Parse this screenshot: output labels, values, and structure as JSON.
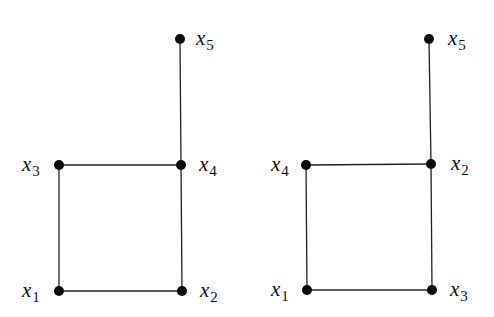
{
  "graphs": [
    {
      "name": "left-graph",
      "nodes": [
        {
          "id": "x1",
          "base": "x",
          "sub": "1",
          "cx": 59,
          "cy": 291,
          "lx": 22,
          "ly": 297
        },
        {
          "id": "x2",
          "base": "x",
          "sub": "2",
          "cx": 182,
          "cy": 291,
          "lx": 200,
          "ly": 297
        },
        {
          "id": "x3",
          "base": "x",
          "sub": "3",
          "cx": 59,
          "cy": 165,
          "lx": 22,
          "ly": 171
        },
        {
          "id": "x4",
          "base": "x",
          "sub": "4",
          "cx": 181,
          "cy": 165,
          "lx": 199,
          "ly": 171
        },
        {
          "id": "x5",
          "base": "x",
          "sub": "5",
          "cx": 180,
          "cy": 39,
          "lx": 196,
          "ly": 45
        }
      ],
      "edges": [
        [
          "x1",
          "x2"
        ],
        [
          "x1",
          "x3"
        ],
        [
          "x3",
          "x4"
        ],
        [
          "x2",
          "x4"
        ],
        [
          "x4",
          "x5"
        ]
      ]
    },
    {
      "name": "right-graph",
      "nodes": [
        {
          "id": "x1",
          "base": "x",
          "sub": "1",
          "cx": 307,
          "cy": 290,
          "lx": 271,
          "ly": 296
        },
        {
          "id": "x3",
          "base": "x",
          "sub": "3",
          "cx": 432,
          "cy": 290,
          "lx": 450,
          "ly": 296
        },
        {
          "id": "x4",
          "base": "x",
          "sub": "4",
          "cx": 306,
          "cy": 165,
          "lx": 271,
          "ly": 171
        },
        {
          "id": "x2",
          "base": "x",
          "sub": "2",
          "cx": 431,
          "cy": 164,
          "lx": 451,
          "ly": 170
        },
        {
          "id": "x5",
          "base": "x",
          "sub": "5",
          "cx": 429,
          "cy": 39,
          "lx": 448,
          "ly": 45
        }
      ],
      "edges": [
        [
          "x1",
          "x3"
        ],
        [
          "x1",
          "x4"
        ],
        [
          "x4",
          "x2"
        ],
        [
          "x3",
          "x2"
        ],
        [
          "x2",
          "x5"
        ]
      ]
    }
  ],
  "colors": {
    "node": "#0a0a0a",
    "edge": "#222222",
    "background": "#ffffff"
  }
}
